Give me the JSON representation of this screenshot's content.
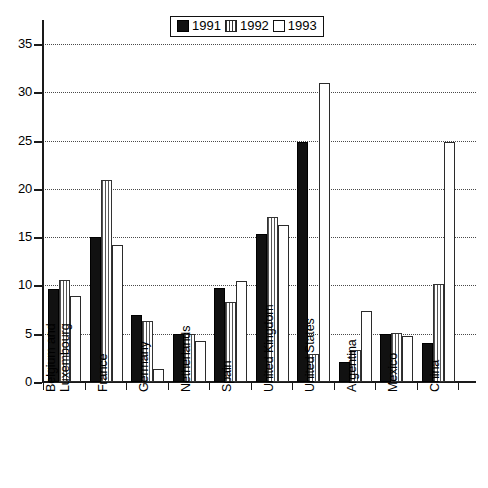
{
  "chart_data": {
    "type": "bar",
    "title": "",
    "xlabel": "",
    "ylabel": "",
    "ylim": [
      0,
      37.5
    ],
    "yticks": [
      0,
      5,
      10,
      15,
      20,
      25,
      30,
      35
    ],
    "ytick_labels": [
      "0",
      "5",
      "10",
      "15",
      "20",
      "25",
      "30",
      "35"
    ],
    "grid": true,
    "legend_position": "top-center",
    "categories": [
      "Belgium and Luxembourg",
      "France",
      "Germany",
      "Netherlands",
      "Spain",
      "United Kingdom",
      "United States",
      "Argentina",
      "Mexico",
      "China"
    ],
    "category_lines": [
      [
        "Belgium and",
        "Luxembourg"
      ],
      [
        "France"
      ],
      [
        "Germany"
      ],
      [
        "Netherlands"
      ],
      [
        "Spain"
      ],
      [
        "United Kingdom"
      ],
      [
        "United States"
      ],
      [
        "Argentina"
      ],
      [
        "Mexico"
      ],
      [
        "China"
      ]
    ],
    "series": [
      {
        "name": "1991",
        "fill": "solid-black",
        "color": "#111111",
        "values": [
          9.6,
          15.0,
          6.9,
          5.0,
          9.7,
          15.3,
          24.9,
          2.1,
          5.0,
          4.0
        ]
      },
      {
        "name": "1992",
        "fill": "vertical-hatch",
        "color": "#555555",
        "values": [
          10.6,
          20.9,
          6.3,
          5.0,
          8.3,
          17.1,
          2.9,
          3.3,
          5.1,
          10.2
        ]
      },
      {
        "name": "1993",
        "fill": "white",
        "color": "#ffffff",
        "values": [
          8.9,
          14.2,
          1.3,
          4.2,
          10.5,
          16.3,
          31.0,
          7.4,
          4.8,
          24.9
        ]
      }
    ]
  },
  "legend": {
    "items": [
      {
        "label": "1991",
        "swatch": "solid-black-swatch"
      },
      {
        "label": "1992",
        "swatch": "hatched-swatch"
      },
      {
        "label": "1993",
        "swatch": "white-swatch"
      }
    ]
  },
  "colors": {
    "axis": "#1a1a1a",
    "grid": "#4a4a4a",
    "series_1991": "#111111",
    "series_1992": "#555555",
    "series_1993": "#ffffff",
    "background": "#ffffff"
  }
}
